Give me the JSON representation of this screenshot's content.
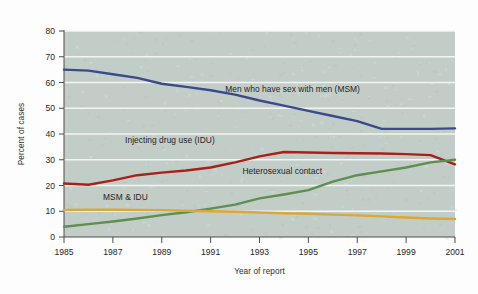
{
  "figure": {
    "background_color": "#fdfdfd",
    "plot_background_color": "#c3cdc8",
    "gridline_color": "#f2f5f3",
    "axis_color": "#4c4c4c"
  },
  "chart_data": {
    "type": "line",
    "title": "",
    "subtitle": "",
    "xlabel": "Year of report",
    "ylabel": "Percent of cases",
    "xlim": [
      1985,
      2001
    ],
    "ylim": [
      0,
      80
    ],
    "ytick_step": 10,
    "xtick_step": 2,
    "grid": true,
    "grid_axis": "y",
    "legend_position": "inline-annotations",
    "yticks": [
      0,
      10,
      20,
      30,
      40,
      50,
      60,
      70,
      80
    ],
    "ytick_labels": [
      "0",
      "10",
      "20",
      "30",
      "40",
      "50",
      "60",
      "70",
      "80"
    ],
    "xticks": [
      1985,
      1987,
      1989,
      1991,
      1993,
      1995,
      1997,
      1999,
      2001
    ],
    "xtick_labels": [
      "1985",
      "1987",
      "1989",
      "1991",
      "1993",
      "1995",
      "1997",
      "1999",
      "2001"
    ],
    "x": [
      1985,
      1986,
      1987,
      1988,
      1989,
      1990,
      1991,
      1992,
      1993,
      1994,
      1995,
      1996,
      1997,
      1998,
      1999,
      2000,
      2001
    ],
    "series": [
      {
        "name": "Men who have sex with men (MSM)",
        "color": "#3b4a8c",
        "values": [
          65.0,
          64.6,
          63.2,
          61.8,
          59.5,
          58.3,
          57.0,
          55.3,
          53.0,
          51.0,
          49.0,
          47.0,
          45.0,
          42.0,
          42.0,
          42.0,
          42.2
        ],
        "label": "Men who have sex with men (MSM)",
        "label_x": 1991.6,
        "label_y": 56.5
      },
      {
        "name": "Injecting drug use (IDU)",
        "color": "#a8201a",
        "values": [
          20.8,
          20.3,
          22.0,
          24.0,
          25.0,
          25.8,
          27.0,
          29.0,
          31.3,
          33.0,
          32.8,
          32.6,
          32.5,
          32.4,
          32.2,
          31.8,
          28.2
        ],
        "label": "Injecting drug use (IDU)",
        "label_x": 1987.5,
        "label_y": 36.5
      },
      {
        "name": "Heterosexual contact",
        "color": "#5e8f4e",
        "values": [
          4.0,
          5.0,
          6.0,
          7.2,
          8.5,
          9.6,
          11.0,
          12.6,
          15.0,
          16.5,
          18.2,
          21.5,
          24.0,
          25.5,
          27.0,
          29.0,
          30.0
        ],
        "label": "Heterosexual contact",
        "label_x": 1992.3,
        "label_y": 24.5
      },
      {
        "name": "MSM & IDU",
        "color": "#d9a836",
        "values": [
          10.5,
          10.6,
          10.6,
          10.5,
          10.4,
          10.2,
          10.0,
          9.8,
          9.5,
          9.2,
          9.0,
          8.7,
          8.4,
          8.0,
          7.6,
          7.2,
          7.0
        ],
        "label": "MSM & IDU",
        "label_x": 1986.6,
        "label_y": 14.2
      }
    ]
  }
}
